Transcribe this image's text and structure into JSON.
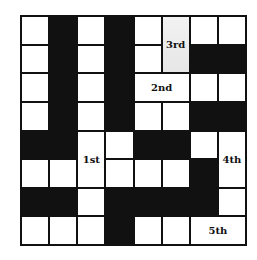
{
  "puzzle": {
    "rows": 8,
    "cols": 8,
    "colors": {
      "black": "#111111",
      "white": "#ffffff",
      "shaded": "#e8e8e8"
    },
    "black_cells": [
      [
        0,
        1
      ],
      [
        0,
        3
      ],
      [
        1,
        1
      ],
      [
        1,
        3
      ],
      [
        1,
        6
      ],
      [
        1,
        7
      ],
      [
        2,
        1
      ],
      [
        2,
        3
      ],
      [
        3,
        1
      ],
      [
        3,
        3
      ],
      [
        3,
        6
      ],
      [
        3,
        7
      ],
      [
        4,
        0
      ],
      [
        4,
        1
      ],
      [
        4,
        4
      ],
      [
        4,
        5
      ],
      [
        5,
        6
      ],
      [
        6,
        0
      ],
      [
        6,
        1
      ],
      [
        6,
        3
      ],
      [
        6,
        4
      ],
      [
        6,
        5
      ],
      [
        6,
        6
      ],
      [
        7,
        3
      ]
    ],
    "labels": {
      "first": "1st",
      "second": "2nd",
      "third": "3rd",
      "fourth": "4th",
      "fifth": "5th"
    }
  }
}
